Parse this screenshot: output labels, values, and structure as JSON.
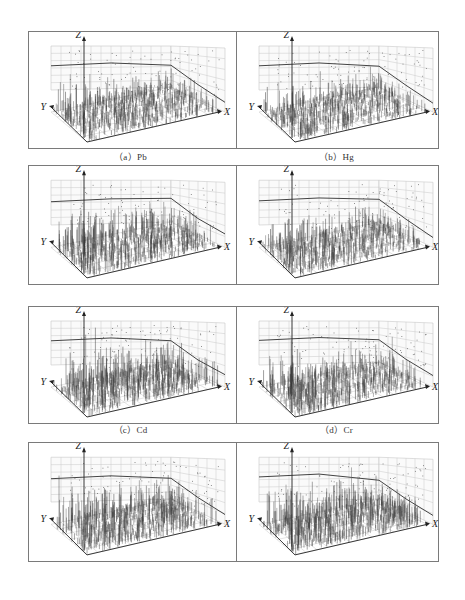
{
  "figure": {
    "axes": {
      "x_label": "X",
      "y_label": "Y",
      "z_label": "Z"
    }
  },
  "panels": [
    {
      "id": "a",
      "caption": "（a）Pb",
      "element": "Pb"
    },
    {
      "id": "b",
      "caption": "（b）Hg",
      "element": "Hg"
    },
    {
      "id": "c",
      "caption": "（c）Cd",
      "element": "Cd"
    },
    {
      "id": "d",
      "caption": "（d）Cr",
      "element": "Cr"
    },
    {
      "id": "e",
      "caption": "（e）As",
      "element": "As"
    },
    {
      "id": "f",
      "caption": "（f）Zn",
      "element": "Zn"
    },
    {
      "id": "g",
      "caption": "（g）Cu",
      "element": "Cu"
    },
    {
      "id": "h",
      "caption": "（h）Ni",
      "element": "Ni"
    }
  ],
  "chart_data": [
    {
      "type": "scatter",
      "title": "（a）Pb",
      "xlabel": "X",
      "ylabel": "Y",
      "zlabel": "Z",
      "render": "3d-spike",
      "seed": 11,
      "density": 1.0,
      "height": 0.62,
      "trend_back": [
        0.55,
        0.45
      ],
      "trend_side": [
        0.45,
        0.78
      ],
      "grid": true
    },
    {
      "type": "scatter",
      "title": "（b）Hg",
      "xlabel": "X",
      "ylabel": "Y",
      "zlabel": "Z",
      "render": "3d-spike",
      "seed": 23,
      "density": 1.0,
      "height": 0.58,
      "trend_back": [
        0.55,
        0.43
      ],
      "trend_side": [
        0.43,
        0.8
      ],
      "grid": true
    },
    {
      "type": "scatter",
      "title": "（c）Cd",
      "xlabel": "X",
      "ylabel": "Y",
      "zlabel": "Z",
      "render": "3d-spike",
      "seed": 37,
      "density": 1.0,
      "height": 0.72,
      "trend_back": [
        0.52,
        0.48
      ],
      "trend_side": [
        0.48,
        0.7
      ],
      "grid": true
    },
    {
      "type": "scatter",
      "title": "（d）Cr",
      "xlabel": "X",
      "ylabel": "Y",
      "zlabel": "Z",
      "render": "3d-spike",
      "seed": 41,
      "density": 1.0,
      "height": 0.6,
      "trend_back": [
        0.54,
        0.46
      ],
      "trend_side": [
        0.46,
        0.78
      ],
      "grid": true
    },
    {
      "type": "scatter",
      "title": "（e）As",
      "xlabel": "X",
      "ylabel": "Y",
      "zlabel": "Z",
      "render": "3d-spike",
      "seed": 53,
      "density": 1.05,
      "height": 0.8,
      "trend_back": [
        0.55,
        0.44
      ],
      "trend_side": [
        0.44,
        0.72
      ],
      "grid": true
    },
    {
      "type": "scatter",
      "title": "（f）Zn",
      "xlabel": "X",
      "ylabel": "Y",
      "zlabel": "Z",
      "render": "3d-spike",
      "seed": 67,
      "density": 1.0,
      "height": 0.7,
      "trend_back": [
        0.56,
        0.46
      ],
      "trend_side": [
        0.46,
        0.74
      ],
      "grid": true
    },
    {
      "type": "scatter",
      "title": "（g）Cu",
      "xlabel": "X",
      "ylabel": "Y",
      "zlabel": "Z",
      "render": "3d-spike",
      "seed": 79,
      "density": 1.0,
      "height": 0.74,
      "trend_back": [
        0.52,
        0.42
      ],
      "trend_side": [
        0.42,
        0.78
      ],
      "grid": true
    },
    {
      "type": "scatter",
      "title": "（h）Ni",
      "xlabel": "X",
      "ylabel": "Y",
      "zlabel": "Z",
      "render": "3d-spike",
      "seed": 97,
      "density": 1.1,
      "height": 0.76,
      "trend_back": [
        0.56,
        0.38
      ],
      "trend_side": [
        0.38,
        0.8
      ],
      "grid": true
    }
  ],
  "layout": {
    "rows": [
      {
        "top": 0,
        "height": 116,
        "caption_top": 119
      },
      {
        "top": 134,
        "height": 118,
        "caption_top": 258
      },
      {
        "top": 275,
        "height": 116,
        "caption_top": 397
      },
      {
        "top": 411,
        "height": 118,
        "caption_top": 535
      }
    ],
    "colors": {
      "frame": "#7a7a7a",
      "grid": "#c8c8c8",
      "spike": "#3a3a3a",
      "axis": "#222222",
      "trend": "#444444"
    }
  }
}
